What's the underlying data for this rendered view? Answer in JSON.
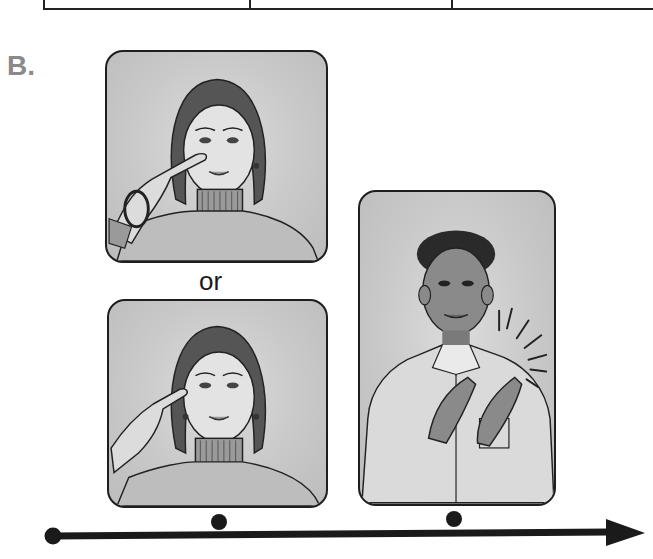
{
  "section": {
    "label": "B."
  },
  "separator": {
    "text": "or"
  },
  "table_fragment": {
    "visible": "bottom border only",
    "column_count": 3
  },
  "panels": [
    {
      "id": "panel-1",
      "description": "Woman touching index finger to nose",
      "position": "top-left"
    },
    {
      "id": "panel-2",
      "description": "Woman touching index finger to temple",
      "position": "bottom-left"
    },
    {
      "id": "panel-3",
      "description": "Boy clapping hands with motion lines",
      "position": "right"
    }
  ],
  "timeline": {
    "direction": "left-to-right",
    "markers": 3,
    "arrow": "right-arrowhead",
    "color": "#1a1a1a"
  },
  "colors": {
    "label_gray": "#8a8a8a",
    "panel_border": "#1e1e1e",
    "panel_fill": "#c9c9c9",
    "ink": "#1a1a1a"
  }
}
